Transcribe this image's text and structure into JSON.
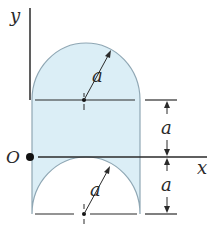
{
  "diagram": {
    "type": "area-geometry",
    "labels": {
      "y_axis": "y",
      "x_axis": "x",
      "origin": "O",
      "upper_radius": "a",
      "lower_radius": "a",
      "dim_upper": "a",
      "dim_lower": "a"
    },
    "colors": {
      "fill": "#dbeef6",
      "outline": "#8fa7b4",
      "line": "#2a2a2a"
    }
  }
}
